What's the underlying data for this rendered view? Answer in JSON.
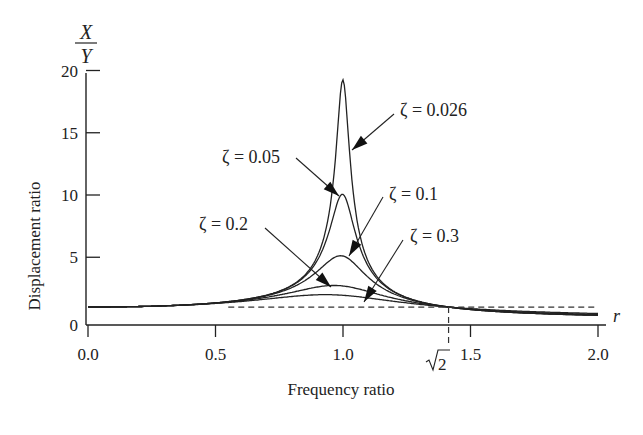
{
  "chart_data": {
    "type": "line",
    "title": "",
    "xlabel": "Frequency ratio",
    "ylabel": "Displacement ratio",
    "y_fraction_label": {
      "numerator": "X",
      "denominator": "Y"
    },
    "x_axis_symbol": "r",
    "xlim": [
      0.0,
      2.0
    ],
    "ylim": [
      0,
      20
    ],
    "x_ticks": [
      "0.0",
      "0.5",
      "1.0",
      "1.5",
      "2.0"
    ],
    "x_tick_values": [
      0.0,
      0.5,
      1.0,
      1.5,
      2.0
    ],
    "y_ticks": [
      "0",
      "5",
      "10",
      "15",
      "20"
    ],
    "y_tick_values": [
      0,
      5,
      10,
      15,
      20
    ],
    "grid": false,
    "legend": "none (curves annotated with arrows)",
    "annotations": [
      {
        "text": "ζ = 0.026",
        "points_to_r": 1.03,
        "points_to_value": 13.8
      },
      {
        "text": "ζ = 0.05",
        "points_to_r": 0.98,
        "points_to_value": 9.8
      },
      {
        "text": "ζ = 0.1",
        "points_to_r": 1.02,
        "points_to_value": 5.1
      },
      {
        "text": "ζ = 0.2",
        "points_to_r": 0.95,
        "points_to_value": 2.8
      },
      {
        "text": "ζ = 0.3",
        "points_to_r": 1.12,
        "points_to_value": 1.9
      },
      {
        "text": "√2",
        "kind": "dashed vertical marker",
        "r": 1.414
      }
    ],
    "reference_line": {
      "style": "dashed",
      "value": 1,
      "from_r": 0.55,
      "to_r": 2.0
    },
    "x": [
      0.0,
      0.2,
      0.4,
      0.6,
      0.7,
      0.8,
      0.9,
      0.95,
      1.0,
      1.05,
      1.1,
      1.2,
      1.3,
      1.414,
      1.6,
      1.8,
      2.0
    ],
    "series": [
      {
        "name": "ζ = 0.026",
        "zeta": 0.026,
        "peak": 19.2,
        "values": [
          1.0,
          1.04,
          1.19,
          1.56,
          1.96,
          2.77,
          5.22,
          9.4,
          19.2,
          9.5,
          4.6,
          2.2,
          1.44,
          1.0,
          0.64,
          0.45,
          0.34
        ]
      },
      {
        "name": "ζ = 0.05",
        "zeta": 0.05,
        "peak": 10.0,
        "values": [
          1.0,
          1.04,
          1.19,
          1.56,
          1.96,
          2.76,
          5.06,
          8.1,
          10.05,
          7.8,
          4.4,
          2.2,
          1.45,
          1.0,
          0.65,
          0.46,
          0.35
        ]
      },
      {
        "name": "ζ = 0.1",
        "zeta": 0.1,
        "peak": 5.1,
        "values": [
          1.0,
          1.04,
          1.19,
          1.56,
          1.95,
          2.7,
          4.3,
          5.0,
          5.1,
          4.6,
          3.5,
          2.05,
          1.43,
          1.0,
          0.68,
          0.5,
          0.39
        ]
      },
      {
        "name": "ζ = 0.2",
        "zeta": 0.2,
        "peak": 2.7,
        "values": [
          1.0,
          1.04,
          1.18,
          1.53,
          1.86,
          2.31,
          2.72,
          2.76,
          2.69,
          2.55,
          2.32,
          1.78,
          1.37,
          1.0,
          0.74,
          0.6,
          0.51
        ]
      },
      {
        "name": "ζ = 0.3",
        "zeta": 0.3,
        "peak": 1.95,
        "values": [
          1.0,
          1.04,
          1.17,
          1.48,
          1.72,
          1.97,
          2.03,
          2.0,
          1.94,
          1.85,
          1.74,
          1.5,
          1.29,
          1.0,
          0.83,
          0.71,
          0.63
        ]
      }
    ]
  }
}
